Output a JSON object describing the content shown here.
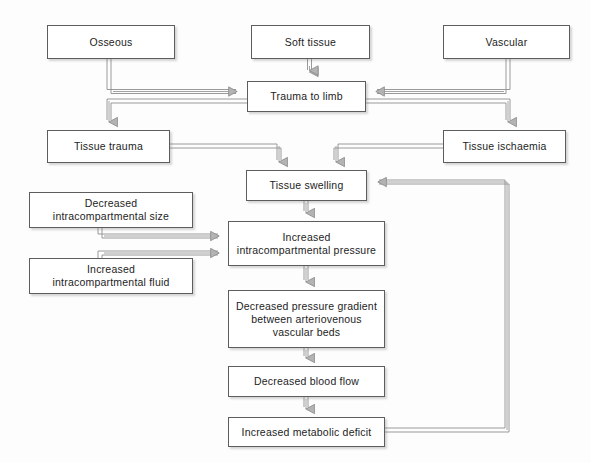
{
  "diagram": {
    "background_color": "#fdfdfd",
    "box_border_color": "#5d5d5d",
    "box_fill_color": "#ffffff",
    "connector_color": "#8a8a8a",
    "text_color": "#1d1d1d",
    "nodes": [
      {
        "id": "osseous",
        "label": "Osseous",
        "x": 47,
        "y": 25,
        "w": 128,
        "h": 34
      },
      {
        "id": "soft_tissue",
        "label": "Soft tissue",
        "x": 251,
        "y": 25,
        "w": 119,
        "h": 34
      },
      {
        "id": "vascular",
        "label": "Vascular",
        "x": 443,
        "y": 25,
        "w": 127,
        "h": 34
      },
      {
        "id": "trauma",
        "label": "Trauma to limb",
        "x": 247,
        "y": 81,
        "w": 119,
        "h": 31
      },
      {
        "id": "tissue_trauma",
        "label": "Tissue trauma",
        "x": 47,
        "y": 130,
        "w": 123,
        "h": 33
      },
      {
        "id": "tissue_isch",
        "label": "Tissue ischaemia",
        "x": 443,
        "y": 130,
        "w": 123,
        "h": 33
      },
      {
        "id": "swelling",
        "label": "Tissue swelling",
        "x": 246,
        "y": 170,
        "w": 121,
        "h": 31
      },
      {
        "id": "dec_size",
        "label": "Decreased\nintracompartmental size",
        "x": 29,
        "y": 192,
        "w": 164,
        "h": 36
      },
      {
        "id": "inc_fluid",
        "label": "Increased\nintracompartmental fluid",
        "x": 29,
        "y": 258,
        "w": 164,
        "h": 36
      },
      {
        "id": "inc_pressure",
        "label": "Increased\nintracompartmental pressure",
        "x": 228,
        "y": 221,
        "w": 157,
        "h": 45
      },
      {
        "id": "dec_gradient",
        "label": "Decreased pressure gradient\nbetween arteriovenous\nvascular beds",
        "x": 228,
        "y": 290,
        "w": 157,
        "h": 58
      },
      {
        "id": "dec_flow",
        "label": "Decreased blood flow",
        "x": 228,
        "y": 366,
        "w": 157,
        "h": 31
      },
      {
        "id": "metabolic",
        "label": "Increased metabolic deficit",
        "x": 228,
        "y": 417,
        "w": 157,
        "h": 30
      }
    ],
    "edges": [
      {
        "id": "soft-tissue-to-trauma",
        "from": "soft_tissue",
        "to": "trauma",
        "kind": "vertical-down"
      },
      {
        "id": "osseous-to-trauma",
        "from": "osseous",
        "to": "trauma",
        "kind": "elbow-right"
      },
      {
        "id": "vascular-to-trauma",
        "from": "vascular",
        "to": "trauma",
        "kind": "elbow-left"
      },
      {
        "id": "trauma-to-tissue-trauma",
        "from": "trauma",
        "to": "tissue_trauma",
        "kind": "elbow-down-left"
      },
      {
        "id": "trauma-to-tissue-isch",
        "from": "trauma",
        "to": "tissue_isch",
        "kind": "elbow-down-right"
      },
      {
        "id": "tissue-trauma-to-swelling",
        "from": "tissue_trauma",
        "to": "swelling",
        "kind": "elbow-down"
      },
      {
        "id": "tissue-isch-to-swelling",
        "from": "tissue_isch",
        "to": "swelling",
        "kind": "elbow-down"
      },
      {
        "id": "swelling-to-pressure",
        "from": "swelling",
        "to": "inc_pressure",
        "kind": "vertical-down"
      },
      {
        "id": "dec-size-to-pressure",
        "from": "dec_size",
        "to": "inc_pressure",
        "kind": "elbow-right"
      },
      {
        "id": "inc-fluid-to-pressure",
        "from": "inc_fluid",
        "to": "inc_pressure",
        "kind": "elbow-right"
      },
      {
        "id": "pressure-to-gradient",
        "from": "inc_pressure",
        "to": "dec_gradient",
        "kind": "vertical-down"
      },
      {
        "id": "gradient-to-flow",
        "from": "dec_gradient",
        "to": "dec_flow",
        "kind": "vertical-down"
      },
      {
        "id": "flow-to-metabolic",
        "from": "dec_flow",
        "to": "metabolic",
        "kind": "vertical-down"
      },
      {
        "id": "metabolic-to-swelling",
        "from": "metabolic",
        "to": "swelling",
        "kind": "feedback-loop"
      }
    ]
  }
}
